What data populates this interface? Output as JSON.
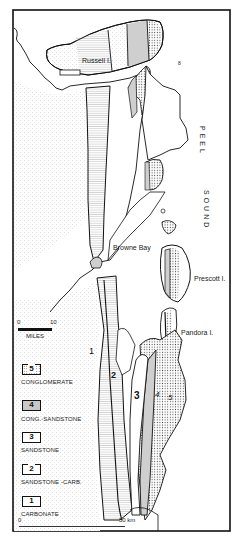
{
  "map": {
    "place_labels": {
      "russell_island": "Russell I.",
      "peel": "PEEL",
      "sound": "SOUND",
      "browne_bay": "Browne Bay",
      "prescott_island": "Prescott I.",
      "pandora_island": "Pandora I.",
      "small_mark": "8"
    },
    "unit_labels_on_map": [
      "1",
      "2",
      "3",
      "4",
      "5"
    ],
    "scale_bar_miles": {
      "start": "0",
      "end": "10",
      "unit": "MILES"
    },
    "scale_bar_km": {
      "start": "0",
      "end": "50 km"
    }
  },
  "legend": {
    "items": [
      {
        "number": "5",
        "label": "CONGLOMERATE",
        "pattern": "dots"
      },
      {
        "number": "4",
        "label": "CONG.-SANDSTONE",
        "pattern": "grey"
      },
      {
        "number": "3",
        "label": "SANDSTONE",
        "pattern": "blank"
      },
      {
        "number": "2",
        "label": "SANDSTONE -CARB.",
        "pattern": "lines"
      },
      {
        "number": "1",
        "label": "CARBONATE",
        "pattern": "blank"
      }
    ]
  },
  "colors": {
    "ink": "#111111",
    "grey_fill": "#c8c8c8",
    "background": "#ffffff"
  }
}
